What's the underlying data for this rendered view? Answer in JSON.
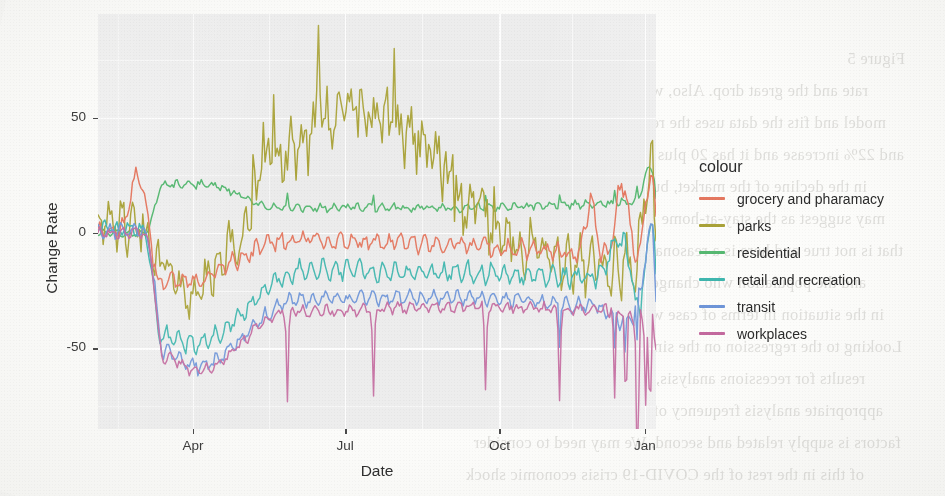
{
  "page": {
    "kind": "scanned-figure",
    "ghost_text_lines": [
      "Figure 5",
      "rate and the great drop. Also, we use the Katsiraj robo- of the",
      "model and fits the data uses the restore force of the volume is going up",
      "and 22% increase and it has 20 plus Sectors on the",
      "in the decline of the market, but could on the basis of that the model",
      "may suggest as the stay-at-home orders and the entire country to",
      "that is not true and here is a reasonable mapping of these",
      "and the population who changed their mobility during the",
      "in the situation in terms of case with the prediction model",
      "Looking to the regression on the simultaneous of the current recession",
      "results for recessions analysis, the performance of the index are extracted as",
      "appropriate analysis frequency of recessions. As for the second recession",
      "factors is supply related and second. We may need to consider",
      "of this in the rest of the COVID-19 crisis economic shock"
    ]
  },
  "chart_data": {
    "type": "line",
    "title": "",
    "xlabel": "Date",
    "ylabel": "Change Rate",
    "ylim": [
      -85,
      95
    ],
    "yticks": [
      50,
      0,
      -50
    ],
    "ytick_labels": [
      "50",
      "0",
      "-50"
    ],
    "xticks": [
      "Apr",
      "Jul",
      "Oct",
      "Jan"
    ],
    "xtick_positions_frac": [
      0.1703,
      0.443,
      0.7194,
      0.9803
    ],
    "grid": "white-major-and-minor",
    "legend_position": "right",
    "legend_title": "colour",
    "panel_background": "#EBEBEB",
    "x_domain": "2020-02-15 to 2021-01-05",
    "series": [
      {
        "name": "grocery and pharamacy",
        "colour": "#E4775F",
        "values": [
          2,
          1,
          1,
          -1,
          0,
          1,
          0,
          1,
          1,
          0,
          0,
          1,
          0,
          2,
          3,
          2,
          5,
          9,
          14,
          20,
          21,
          16,
          11,
          6,
          3,
          -1,
          -6,
          -12,
          -16,
          -19,
          -21,
          -20,
          -18,
          -17,
          -18,
          -19,
          -19,
          -20,
          -21,
          -20,
          -19,
          -18,
          -17,
          -17,
          -18,
          -17,
          -16,
          -15,
          -14,
          -13,
          -13,
          -12,
          -11,
          -10,
          -10,
          -9,
          -9,
          -8,
          -8,
          -7,
          -6,
          -7,
          -6,
          -6,
          -5,
          -5,
          -4,
          -5,
          -4,
          -4,
          -3,
          -4,
          -3,
          -3,
          -2,
          -3,
          -3,
          -2,
          -2,
          -3,
          -2,
          -2,
          -3,
          -3,
          -2,
          -4,
          -3,
          -2,
          -1,
          -2,
          -1,
          0,
          -1,
          -1,
          -2,
          -1,
          -1,
          -2,
          -2,
          -3,
          -2,
          -3,
          -2,
          -3,
          -2,
          -3,
          -4,
          -3,
          -4,
          -3,
          -2,
          -3,
          -4,
          -3,
          -4,
          -3,
          -4,
          -4,
          -3,
          -4,
          -5,
          -4,
          -5,
          -4,
          -5,
          -4,
          -3,
          -4,
          -5,
          -4,
          -5,
          -6,
          -5,
          -6,
          -5,
          -6,
          -5,
          -4,
          -5,
          -6,
          -5,
          -4,
          -3,
          -4,
          -5,
          -4,
          -5,
          -6,
          -5,
          -6,
          -7,
          -6,
          -5,
          -6,
          -5,
          -6,
          -7,
          -6,
          -7,
          -6,
          -5,
          -6,
          -7,
          -6,
          -7,
          -6,
          -5,
          -6,
          -5,
          -6,
          -7,
          -6,
          -7,
          -8,
          -7,
          -6,
          -5,
          -6,
          -7,
          -6,
          -5,
          -6,
          -7,
          -6,
          -5,
          -4,
          -5,
          -6,
          -7,
          -6,
          -5,
          -6,
          -7,
          -8,
          -7,
          -6,
          -7,
          -8,
          -7,
          -6,
          -7,
          -8,
          -7,
          -8,
          -7,
          -6,
          -7,
          -8,
          -9,
          -8,
          -7,
          -8,
          -9,
          -8,
          -7,
          -8,
          -9,
          -8,
          -9,
          -10,
          -9,
          -8,
          -7,
          -6,
          -5,
          -7,
          -9,
          -8,
          -7,
          -8,
          -9,
          -10,
          -9,
          -8,
          -9,
          -10,
          -9,
          -8,
          -9,
          -10,
          -9,
          -8,
          -7,
          -8,
          -9,
          -10,
          -9,
          -8,
          -9,
          -8,
          -7,
          -8,
          -9,
          -8,
          -9,
          -10,
          -9,
          -8,
          -7,
          -6,
          -8,
          -10,
          -9,
          -8,
          -9,
          -10,
          -9,
          -8,
          -10,
          -12,
          -11,
          -10,
          -9,
          -8,
          -7,
          -5,
          0,
          10,
          22,
          20,
          12,
          4,
          -2,
          -5,
          -6,
          -7,
          -8,
          -9,
          -8,
          -7,
          -8,
          -9,
          -10,
          -9,
          -8,
          -9,
          -10,
          -11,
          -10,
          -9,
          -10,
          -11,
          -10,
          -9,
          -8,
          -7,
          -5,
          -2,
          4,
          12,
          20,
          24,
          21,
          14,
          5,
          0,
          -3,
          -6,
          -8,
          -7,
          -6,
          -4,
          0,
          6,
          14,
          21,
          26,
          22,
          14,
          6
        ]
      },
      {
        "name": "parks",
        "colour": "#A9A238"
      },
      {
        "name": "residential",
        "colour": "#56B871"
      },
      {
        "name": "retail and recreation",
        "colour": "#3FB6AE"
      },
      {
        "name": "transit",
        "colour": "#6E95D8"
      },
      {
        "name": "workplaces",
        "colour": "#C3699E"
      }
    ],
    "legend_entries": [
      {
        "label": "grocery and pharamacy",
        "colour": "#E4775F"
      },
      {
        "label": "parks",
        "colour": "#A9A238"
      },
      {
        "label": "residential",
        "colour": "#56B871"
      },
      {
        "label": "retail and recreation",
        "colour": "#3FB6AE"
      },
      {
        "label": "transit",
        "colour": "#6E95D8"
      },
      {
        "label": "workplaces",
        "colour": "#C3699E"
      }
    ]
  },
  "axes": {
    "y": {
      "label": "Change Rate",
      "ticks": [
        {
          "value": 50,
          "label": "50"
        },
        {
          "value": 0,
          "label": "0"
        },
        {
          "value": -50,
          "label": "-50"
        }
      ]
    },
    "x": {
      "label": "Date",
      "ticks": [
        {
          "label": "Apr"
        },
        {
          "label": "Jul"
        },
        {
          "label": "Oct"
        },
        {
          "label": "Jan"
        }
      ]
    }
  },
  "legend": {
    "title": "colour"
  }
}
